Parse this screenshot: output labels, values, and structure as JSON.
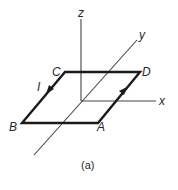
{
  "diagram": {
    "axes": {
      "x_label": "x",
      "y_label": "y",
      "z_label": "z"
    },
    "loop": {
      "corners": {
        "A": "A",
        "B": "B",
        "C": "C",
        "D": "D"
      },
      "current_label": "I"
    },
    "caption": "(a)",
    "colors": {
      "line": "#1a1a1a",
      "axis": "#444444",
      "background": "#ffffff"
    }
  }
}
